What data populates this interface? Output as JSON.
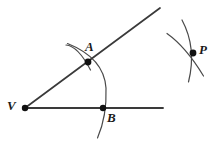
{
  "figure": {
    "background_color": "#ffffff",
    "stroke_color": "#2b2b2b",
    "ray_stroke_color": "#3a3a3a",
    "arc_stroke_color": "#4a4a4a",
    "point_color": "#111111",
    "labels": {
      "vertex": "V",
      "point_a": "A",
      "point_b": "B",
      "point_p": "P"
    },
    "points": [
      {
        "name": "V",
        "x": 25,
        "y": 108,
        "radius": 3.2
      },
      {
        "name": "A",
        "x": 88,
        "y": 62,
        "radius": 3.4
      },
      {
        "name": "B",
        "x": 103,
        "y": 108,
        "radius": 3.2
      },
      {
        "name": "P",
        "x": 193,
        "y": 53,
        "radius": 3.4
      }
    ],
    "rays": [
      {
        "name": "upper-ray",
        "x1": 25,
        "y1": 108,
        "x2": 160,
        "y2": 8,
        "width": 1.7
      },
      {
        "name": "lower-ray",
        "x1": 25,
        "y1": 108,
        "x2": 163,
        "y2": 108,
        "width": 1.9
      }
    ],
    "arcs": [
      {
        "name": "main-arc-through-a-and-b",
        "path": "M 67.5 43.5 Q 104 58 106 88 Q 107 116 97.5 138",
        "width": 1.2
      },
      {
        "name": "small-arc-at-a",
        "path": "M 66 45 Q 78 46 90.5 70",
        "width": 1.2
      },
      {
        "name": "arc-p-steep",
        "path": "M 182 20 Q 197 48 188.5 82",
        "width": 1.2
      },
      {
        "name": "arc-p-diagonal",
        "path": "M 167 33.5 Q 186 47 203.5 76",
        "width": 1.2
      }
    ]
  }
}
